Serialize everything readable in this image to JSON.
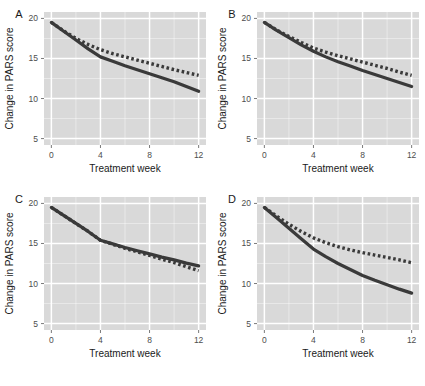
{
  "figure": {
    "panel_background_color": "#d9d9d9",
    "gridline_color": "#ffffff",
    "figure_background_color": "#ffffff",
    "series_color": "#3a3a3a",
    "axis_text_color": "#4d4d4d"
  },
  "axes": {
    "xlabel": "Treatment week",
    "ylabel": "Change in PARS score",
    "xticks": [
      "0",
      "4",
      "8",
      "12"
    ],
    "yticks": [
      "5",
      "10",
      "15",
      "20"
    ],
    "xlim": [
      -0.6,
      12.6
    ],
    "ylim": [
      4.2,
      20.8
    ]
  },
  "panel_tags": {
    "a": "A",
    "b": "B",
    "c": "C",
    "d": "D"
  },
  "chart_data": [
    {
      "type": "line",
      "panel": "A",
      "title": "A",
      "xlabel": "Treatment week",
      "ylabel": "Change in PARS score",
      "xlim": [
        -0.6,
        12.6
      ],
      "ylim": [
        4.2,
        20.8
      ],
      "xticks": [
        0,
        4,
        8,
        12
      ],
      "yticks": [
        5,
        10,
        15,
        20
      ],
      "grid": true,
      "legend": "none",
      "series": [
        {
          "name": "solid",
          "style": "solid",
          "x": [
            0,
            1,
            2,
            3,
            4,
            5,
            6,
            7,
            8,
            9,
            10,
            11,
            12
          ],
          "values": [
            19.5,
            18.4,
            17.3,
            16.2,
            15.2,
            14.65,
            14.1,
            13.6,
            13.1,
            12.6,
            12.1,
            11.5,
            10.9
          ]
        },
        {
          "name": "dotted",
          "style": "dotted",
          "x": [
            0,
            1,
            2,
            3,
            4,
            5,
            6,
            7,
            8,
            9,
            10,
            11,
            12
          ],
          "values": [
            19.5,
            18.45,
            17.5,
            16.75,
            16.1,
            15.6,
            15.2,
            14.8,
            14.4,
            14.0,
            13.6,
            13.25,
            12.9
          ]
        }
      ]
    },
    {
      "type": "line",
      "panel": "B",
      "title": "B",
      "xlabel": "Treatment week",
      "ylabel": "Change in PARS score",
      "xlim": [
        -0.6,
        12.6
      ],
      "ylim": [
        4.2,
        20.8
      ],
      "xticks": [
        0,
        4,
        8,
        12
      ],
      "yticks": [
        5,
        10,
        15,
        20
      ],
      "grid": true,
      "legend": "none",
      "series": [
        {
          "name": "solid",
          "style": "solid",
          "x": [
            0,
            1,
            2,
            3,
            4,
            5,
            6,
            7,
            8,
            9,
            10,
            11,
            12
          ],
          "values": [
            19.5,
            18.5,
            17.6,
            16.7,
            15.9,
            15.2,
            14.6,
            14.05,
            13.5,
            13.0,
            12.5,
            12.0,
            11.5
          ]
        },
        {
          "name": "dotted",
          "style": "dotted",
          "x": [
            0,
            1,
            2,
            3,
            4,
            5,
            6,
            7,
            8,
            9,
            10,
            11,
            12
          ],
          "values": [
            19.5,
            18.55,
            17.75,
            17.0,
            16.3,
            15.8,
            15.35,
            14.95,
            14.55,
            14.15,
            13.75,
            13.3,
            12.9
          ]
        }
      ]
    },
    {
      "type": "line",
      "panel": "C",
      "title": "C",
      "xlabel": "Treatment week",
      "ylabel": "Change in PARS score",
      "xlim": [
        -0.6,
        12.6
      ],
      "ylim": [
        4.2,
        20.8
      ],
      "xticks": [
        0,
        4,
        8,
        12
      ],
      "yticks": [
        5,
        10,
        15,
        20
      ],
      "grid": true,
      "legend": "none",
      "series": [
        {
          "name": "solid",
          "style": "solid",
          "x": [
            0,
            1,
            2,
            3,
            4,
            5,
            6,
            7,
            8,
            9,
            10,
            11,
            12
          ],
          "values": [
            19.5,
            18.5,
            17.5,
            16.5,
            15.4,
            14.95,
            14.5,
            14.1,
            13.7,
            13.3,
            12.95,
            12.55,
            12.2
          ]
        },
        {
          "name": "dotted",
          "style": "dotted",
          "x": [
            0,
            1,
            2,
            3,
            4,
            5,
            6,
            7,
            8,
            9,
            10,
            11,
            12
          ],
          "values": [
            19.5,
            18.5,
            17.5,
            16.5,
            15.4,
            14.9,
            14.4,
            13.95,
            13.5,
            13.05,
            12.6,
            12.1,
            11.6
          ]
        }
      ]
    },
    {
      "type": "line",
      "panel": "D",
      "title": "D",
      "xlabel": "Treatment week",
      "ylabel": "Change in PARS score",
      "xlim": [
        -0.6,
        12.6
      ],
      "ylim": [
        4.2,
        20.8
      ],
      "xticks": [
        0,
        4,
        8,
        12
      ],
      "yticks": [
        5,
        10,
        15,
        20
      ],
      "grid": true,
      "legend": "none",
      "series": [
        {
          "name": "solid",
          "style": "solid",
          "x": [
            0,
            1,
            2,
            3,
            4,
            5,
            6,
            7,
            8,
            9,
            10,
            11,
            12
          ],
          "values": [
            19.5,
            18.2,
            16.9,
            15.6,
            14.3,
            13.35,
            12.5,
            11.75,
            11.0,
            10.4,
            9.85,
            9.3,
            8.8
          ]
        },
        {
          "name": "dotted",
          "style": "dotted",
          "x": [
            0,
            1,
            2,
            3,
            4,
            5,
            6,
            7,
            8,
            9,
            10,
            11,
            12
          ],
          "values": [
            19.5,
            18.4,
            17.4,
            16.5,
            15.7,
            15.1,
            14.6,
            14.2,
            13.85,
            13.55,
            13.25,
            12.95,
            12.6
          ]
        }
      ]
    }
  ]
}
